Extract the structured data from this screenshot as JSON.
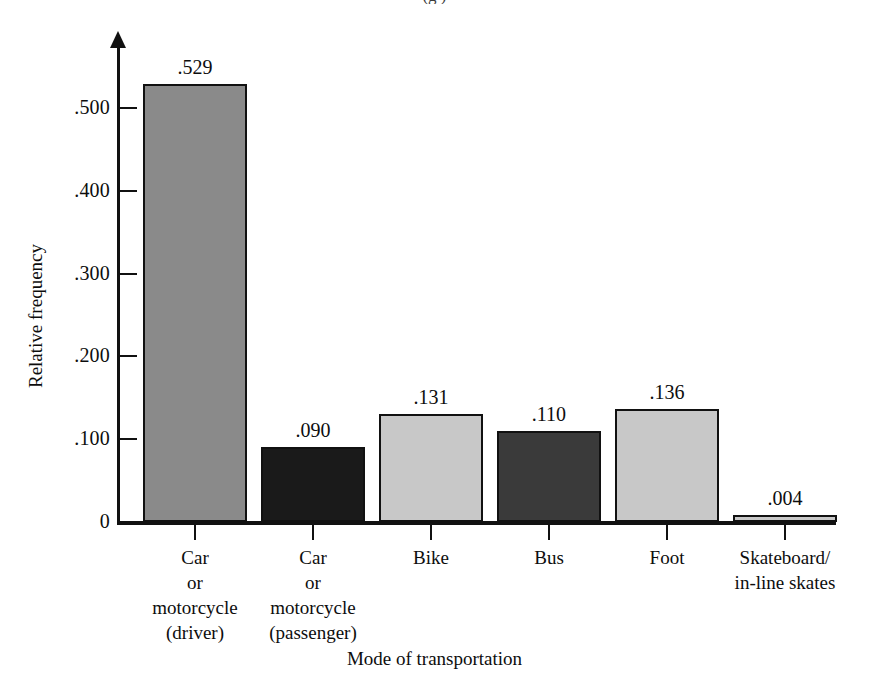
{
  "figure": {
    "top_cropped_caption": "(g     )",
    "background_color": "#ffffff",
    "ink_color": "#111111"
  },
  "chart_data": {
    "type": "bar",
    "title": "",
    "subtitle": "",
    "xlabel": "Mode of transportation",
    "ylabel": "Relative frequency",
    "categories": [
      "Car or motorcycle (driver)",
      "Car or motorcycle (passenger)",
      "Bike",
      "Bus",
      "Foot",
      "Skateboard/in-line skates"
    ],
    "category_lines": [
      [
        "Car",
        "or",
        "motorcycle",
        "(driver)"
      ],
      [
        "Car",
        "or",
        "motorcycle",
        "(passenger)"
      ],
      [
        "Bike"
      ],
      [
        "Bus"
      ],
      [
        "Foot"
      ],
      [
        "Skateboard/",
        "in-line skates"
      ]
    ],
    "values": [
      0.529,
      0.09,
      0.131,
      0.11,
      0.136,
      0.004
    ],
    "value_labels": [
      ".529",
      ".090",
      ".131",
      ".110",
      ".136",
      ".004"
    ],
    "bar_colors": [
      "#8a8a8a",
      "#1a1a1a",
      "#c8c8c8",
      "#3a3a3a",
      "#c8c8c8",
      "#c8c8c8"
    ],
    "bar_edge_color": "#111111",
    "ylim": [
      0,
      0.56
    ],
    "xlim": [
      0,
      6
    ],
    "ytick_values": [
      0,
      0.1,
      0.2,
      0.3,
      0.4,
      0.5
    ],
    "ytick_labels": [
      "0",
      ".100",
      ".200",
      ".300",
      ".400",
      ".500"
    ],
    "grid": false,
    "legend": null,
    "y_axis_arrow": true,
    "tick_direction": "in"
  }
}
